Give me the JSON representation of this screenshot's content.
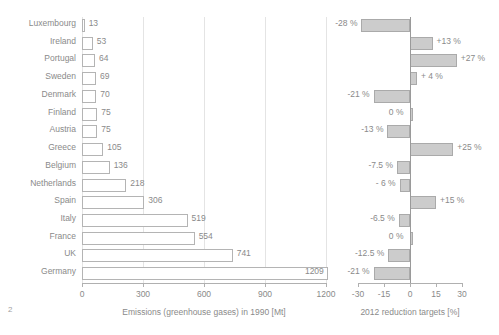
{
  "page": {
    "number": "2",
    "background_color": "#ffffff",
    "text_color": "#8a8a8a"
  },
  "chart_data": [
    {
      "type": "bar",
      "orientation": "horizontal",
      "id": "emissions-1990",
      "title": "",
      "xlabel": "Emissions (greenhouse gases) in 1990 [Mt]",
      "ylabel": "",
      "xlim": [
        0,
        1200
      ],
      "xticks": [
        0,
        300,
        600,
        900,
        1200
      ],
      "xtick_labels": [
        "0",
        "300",
        "600",
        "900",
        "1200"
      ],
      "grid": true,
      "legend": "none",
      "bar_fill": "#ffffff",
      "bar_border": "#b4b4b4",
      "categories": [
        "Luxembourg",
        "Ireland",
        "Portugal",
        "Sweden",
        "Denmark",
        "Finland",
        "Austria",
        "Greece",
        "Belgium",
        "Netherlands",
        "Spain",
        "Italy",
        "France",
        "UK",
        "Germany"
      ],
      "values": [
        13,
        53,
        64,
        69,
        70,
        75,
        75,
        105,
        136,
        218,
        306,
        519,
        554,
        741,
        1209
      ],
      "value_labels": [
        "13",
        "53",
        "64",
        "69",
        "70",
        "75",
        "75",
        "105",
        "136",
        "218",
        "306",
        "519",
        "554",
        "741",
        "1209"
      ],
      "label_placement": [
        "outside",
        "outside",
        "outside",
        "outside",
        "outside",
        "outside",
        "outside",
        "outside",
        "outside",
        "outside",
        "outside",
        "outside",
        "outside",
        "outside",
        "inside"
      ]
    },
    {
      "type": "bar",
      "orientation": "horizontal",
      "id": "reduction-targets-2012",
      "title": "",
      "xlabel": "2012 reduction targets [%]",
      "ylabel": "",
      "xlim": [
        -30,
        30
      ],
      "xticks": [
        -30,
        -15,
        0,
        15,
        30
      ],
      "xtick_labels": [
        "-30",
        "-15",
        "0",
        "15",
        "30"
      ],
      "grid": false,
      "legend": "none",
      "bar_fill": "#cccccc",
      "bar_border": "#aaaaaa",
      "categories": [
        "Luxembourg",
        "Ireland",
        "Portugal",
        "Sweden",
        "Denmark",
        "Finland",
        "Austria",
        "Greece",
        "Belgium",
        "Netherlands",
        "Spain",
        "Italy",
        "France",
        "UK",
        "Germany"
      ],
      "values": [
        -28,
        13,
        27,
        4,
        -21,
        0,
        -13,
        25,
        -7.5,
        -6,
        15,
        -6.5,
        0,
        -12.5,
        -21
      ],
      "value_labels": [
        "-28 %",
        "+13 %",
        "+27 %",
        "+ 4 %",
        "-21 %",
        "0 %",
        "-13 %",
        "+25 %",
        "-7.5 %",
        "- 6 %",
        "+15 %",
        "-6.5 %",
        "0 %",
        "-12.5 %",
        "-21 %"
      ]
    }
  ]
}
